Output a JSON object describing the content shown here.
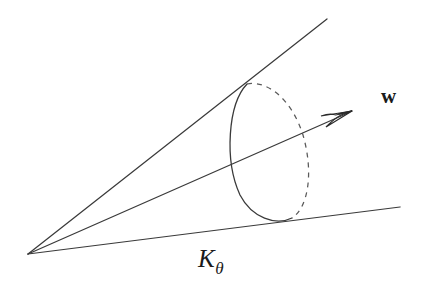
{
  "figure": {
    "background_color": "#ffffff",
    "stroke_color": "#3a3a3a",
    "labels": {
      "cone_symbol": "K",
      "cone_subscript": "θ",
      "vector_symbol": "w"
    },
    "geometry": {
      "apex": [
        28,
        254
      ],
      "upper_edge_end": [
        327,
        19
      ],
      "axis_end": [
        352,
        111
      ],
      "lower_edge_end": [
        400,
        207
      ],
      "cross_section_ellipse": {
        "center": [
          269,
          150
        ],
        "rx": 36,
        "ry": 68,
        "rotation_deg": -13,
        "solid_side": "left",
        "dashed_side": "right"
      },
      "arrow_head_tip": [
        352,
        111
      ]
    }
  }
}
